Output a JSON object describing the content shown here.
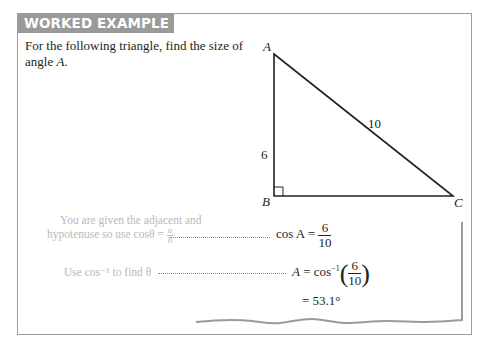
{
  "header": {
    "title": "WORKED EXAMPLE 5.4",
    "tab_color": "#9a9a9a",
    "border_color": "#9d9d9d"
  },
  "question": {
    "text_before": "For the following triangle, find the size of angle ",
    "angle": "A",
    "text_after": "."
  },
  "triangle": {
    "vertices": {
      "A": "A",
      "B": "B",
      "C": "C"
    },
    "sides": {
      "AB": "6",
      "AC": "10"
    },
    "right_angle_at": "B"
  },
  "steps": [
    {
      "explanation_line1": "You are given the adjacent and",
      "explanation_line2": "hypotenuse so use cosθ = ",
      "expl_frac_num": "a",
      "expl_frac_den": "h",
      "result_lhs": "cos A = ",
      "result_frac_num": "6",
      "result_frac_den": "10"
    },
    {
      "explanation": "Use cos⁻¹ to find θ",
      "result_lhs_var": "A",
      "result_eq": " = cos",
      "result_sup": "−1",
      "result_frac_num": "6",
      "result_frac_den": "10",
      "final_answer": "= 53.1°"
    }
  ],
  "colors": {
    "explanation_text": "#b9b9b9",
    "body_text": "#231f20"
  }
}
